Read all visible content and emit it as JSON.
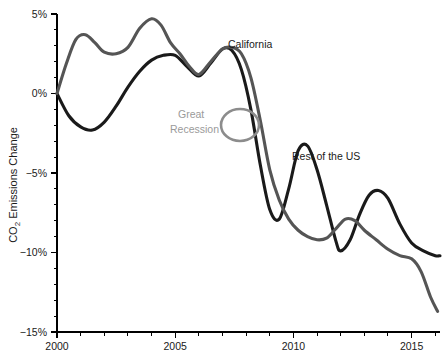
{
  "chart_data": {
    "type": "line",
    "title": "",
    "subtitle": "",
    "xlabel": "",
    "ylabel": "CO2 Emissions Change",
    "ylabel_display": "CO",
    "ylabel_sub": "2",
    "ylabel_rest": " Emissions Change",
    "xlim": [
      2000,
      2016.2
    ],
    "ylim": [
      -15,
      5
    ],
    "grid": false,
    "legend_position": "inline-annotations",
    "x_tick_labels": [
      "2000",
      "2005",
      "2010",
      "2015"
    ],
    "x_tick_values": [
      2000,
      2005,
      2010,
      2015
    ],
    "x_minor_tick_values": [
      2001,
      2002,
      2003,
      2004,
      2006,
      2007,
      2008,
      2009,
      2011,
      2012,
      2013,
      2014,
      2016
    ],
    "y_tick_labels": [
      "5%",
      "0%",
      "-5%",
      "-10%",
      "-15%"
    ],
    "y_tick_values": [
      5,
      0,
      -5,
      -10,
      -15
    ],
    "y_minor_tick_values": [
      4,
      3,
      2,
      1,
      -1,
      -2,
      -3,
      -4,
      -6,
      -7,
      -8,
      -9,
      -11,
      -12,
      -13,
      -14
    ],
    "series": [
      {
        "name": "California",
        "color": "#1a1a1a",
        "width": 3.1,
        "x": [
          2000.0,
          2000.5,
          2001.0,
          2001.5,
          2002.0,
          2002.5,
          2003.0,
          2003.5,
          2004.0,
          2004.5,
          2005.0,
          2005.5,
          2006.0,
          2006.5,
          2007.0,
          2007.4,
          2007.8,
          2008.2,
          2008.6,
          2009.0,
          2009.4,
          2009.8,
          2010.2,
          2010.6,
          2011.0,
          2011.4,
          2011.8,
          2012.0,
          2012.4,
          2012.8,
          2013.2,
          2013.6,
          2014.0,
          2014.5,
          2015.0,
          2015.5,
          2016.0,
          2016.2
        ],
        "y": [
          0.0,
          -1.4,
          -2.1,
          -2.3,
          -1.8,
          -0.8,
          0.4,
          1.4,
          2.1,
          2.4,
          2.4,
          1.7,
          1.1,
          1.9,
          2.8,
          2.7,
          1.5,
          -1.0,
          -4.5,
          -7.3,
          -7.9,
          -6.0,
          -3.6,
          -3.3,
          -4.8,
          -7.0,
          -9.3,
          -9.9,
          -9.2,
          -7.6,
          -6.4,
          -6.1,
          -6.6,
          -8.2,
          -9.4,
          -9.9,
          -10.2,
          -10.2
        ]
      },
      {
        "name": "Rest of the US",
        "color": "#555555",
        "width": 3.1,
        "x": [
          2000.0,
          2000.4,
          2000.8,
          2001.2,
          2001.6,
          2002.0,
          2002.5,
          2003.0,
          2003.5,
          2004.0,
          2004.4,
          2004.8,
          2005.2,
          2005.6,
          2006.0,
          2006.5,
          2007.0,
          2007.4,
          2007.8,
          2008.2,
          2008.6,
          2009.0,
          2009.4,
          2009.8,
          2010.2,
          2010.6,
          2011.0,
          2011.4,
          2011.8,
          2012.2,
          2012.6,
          2013.0,
          2013.5,
          2014.0,
          2014.5,
          2015.0,
          2015.4,
          2015.8,
          2016.1
        ],
        "y": [
          0.0,
          1.9,
          3.4,
          3.7,
          3.2,
          2.6,
          2.5,
          2.9,
          4.1,
          4.7,
          4.3,
          3.2,
          2.5,
          1.7,
          1.2,
          2.0,
          2.8,
          2.9,
          2.5,
          1.0,
          -1.7,
          -4.8,
          -6.7,
          -7.9,
          -8.6,
          -9.0,
          -9.2,
          -9.1,
          -8.5,
          -7.9,
          -8.0,
          -8.6,
          -9.2,
          -9.8,
          -10.2,
          -10.4,
          -11.2,
          -12.8,
          -13.7
        ]
      }
    ],
    "annotations": [
      {
        "id": "california-label",
        "text": "California",
        "x_px": 228,
        "y_px": 48,
        "color": "#1a1a1a",
        "anchor": "start"
      },
      {
        "id": "rest-of-us-label",
        "text": "Rest of the US",
        "x_px": 292,
        "y_px": 160,
        "color": "#1a1a1a",
        "anchor": "start"
      },
      {
        "id": "great-recession-label-line1",
        "text": "Great",
        "x_px": 178,
        "y_px": 118,
        "color": "#9a9a9a",
        "anchor": "start"
      },
      {
        "id": "great-recession-label-line2",
        "text": "Recession",
        "x_px": 170,
        "y_px": 133,
        "color": "#9a9a9a",
        "anchor": "start"
      }
    ],
    "marker_ellipse": {
      "id": "great-recession-circle",
      "cx": 240,
      "cy": 125,
      "rx": 19,
      "ry": 16,
      "color": "#8c8c8c"
    }
  },
  "colors": {
    "background": "#ffffff",
    "axis": "#000000",
    "california": "#1a1a1a",
    "rest_of_us": "#555555",
    "annotation_muted": "#9a9a9a",
    "text": "#1a1a1a"
  },
  "geometry": {
    "plot_left_px": 57,
    "plot_right_px": 440,
    "plot_top_px": 14,
    "plot_bottom_px": 332
  }
}
